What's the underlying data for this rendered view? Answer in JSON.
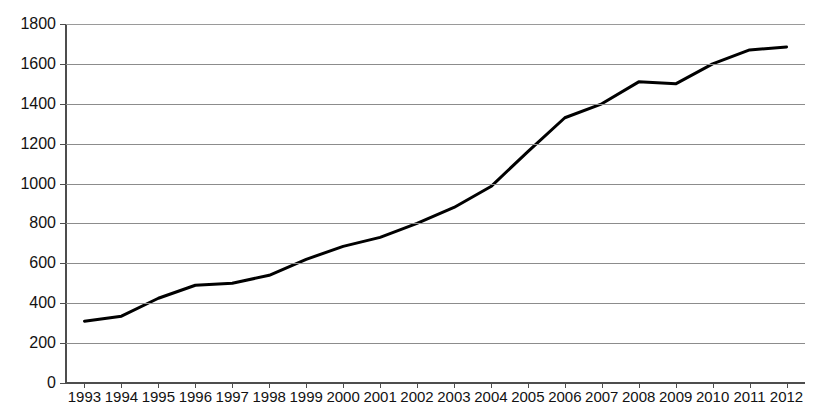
{
  "chart_data": {
    "type": "line",
    "title": "",
    "xlabel": "",
    "ylabel": "",
    "categories": [
      "1993",
      "1994",
      "1995",
      "1996",
      "1997",
      "1998",
      "1999",
      "2000",
      "2001",
      "2002",
      "2003",
      "2004",
      "2005",
      "2006",
      "2007",
      "2008",
      "2009",
      "2010",
      "2011",
      "2012"
    ],
    "values": [
      310,
      335,
      425,
      490,
      500,
      540,
      620,
      685,
      730,
      800,
      880,
      985,
      1160,
      1330,
      1400,
      1510,
      1500,
      1600,
      1670,
      1685
    ],
    "series": [
      {
        "name": "Series 1",
        "values": [
          310,
          335,
          425,
          490,
          500,
          540,
          620,
          685,
          730,
          800,
          880,
          985,
          1160,
          1330,
          1400,
          1510,
          1500,
          1600,
          1670,
          1685
        ]
      }
    ],
    "ylim": [
      0,
      1800
    ],
    "ytick_values": [
      0,
      200,
      400,
      600,
      800,
      1000,
      1200,
      1400,
      1600,
      1800
    ],
    "ytick_labels": [
      "0",
      "200",
      "400",
      "600",
      "800",
      "1000",
      "1200",
      "1400",
      "1600",
      "1800"
    ],
    "grid": true,
    "grid_axis": "y",
    "legend": false,
    "legend_position": "none",
    "line_color": "#000000",
    "line_width": 3,
    "markers": false,
    "grid_color": "#8c8c8c",
    "axis_color": "#4d4d4d",
    "background_color": "#ffffff",
    "text_color": "#121212"
  }
}
